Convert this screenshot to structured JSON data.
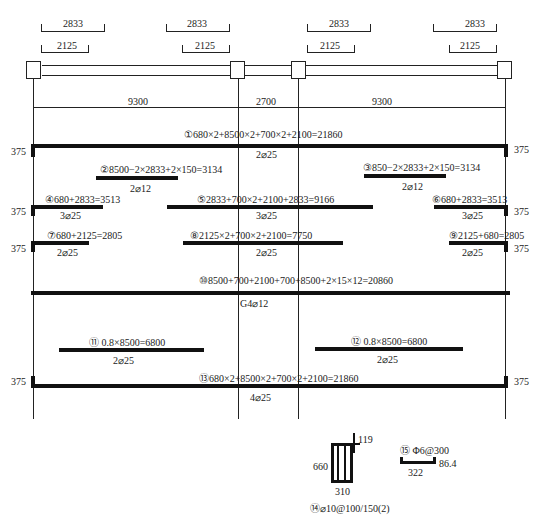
{
  "drawing": {
    "type": "beam reinforcement detail",
    "top_dimensions": [
      {
        "span": "left",
        "outer": "2833",
        "inner": "2125"
      },
      {
        "span": "left-right-end",
        "outer": "2833",
        "inner": "2125"
      },
      {
        "span": "right-left-end",
        "outer": "2833",
        "inner": "2125"
      },
      {
        "span": "right",
        "outer": "2833",
        "inner": "2125"
      }
    ],
    "spans": [
      "9300",
      "2700",
      "9300"
    ],
    "end_hook": "375",
    "bars": [
      {
        "id": "①",
        "formula": "680×2+8500×2+700×2+2100=21860",
        "spec": "2⌀25"
      },
      {
        "id": "②",
        "formula": "8500−2×2833+2×150=3134",
        "spec": "2⌀12"
      },
      {
        "id": "③",
        "formula": "850−2×2833+2×150=3134",
        "spec": "2⌀12"
      },
      {
        "id": "④",
        "formula": "680+2833=3513",
        "spec": "3⌀25"
      },
      {
        "id": "⑤",
        "formula": "2833+700×2+2100+2833=9166",
        "spec": "3⌀25"
      },
      {
        "id": "⑥",
        "formula": "680+2833=3513",
        "spec": "3⌀25"
      },
      {
        "id": "⑦",
        "formula": "680+2125=2805",
        "spec": "2⌀25"
      },
      {
        "id": "⑧",
        "formula": "2125×2+700×2+2100=7750",
        "spec": "2⌀25"
      },
      {
        "id": "⑨",
        "formula": "2125+680=2805",
        "spec": "2⌀25"
      },
      {
        "id": "⑩",
        "formula": "8500+700+2100+700+8500+2×15×12=20860",
        "spec": "G4⌀12"
      },
      {
        "id": "⑪",
        "formula": "0.8×8500=6800",
        "spec": "2⌀25"
      },
      {
        "id": "⑫",
        "formula": "0.8×8500=6800",
        "spec": "2⌀25"
      },
      {
        "id": "⑬",
        "formula": "680×2+8500×2+700×2+2100=21860",
        "spec": "4⌀25"
      }
    ],
    "stirrup": {
      "id": "⑭",
      "spec": "⌀10@100/150(2)",
      "height": "660",
      "width": "310",
      "hook": "119"
    },
    "tie": {
      "id": "⑮",
      "spec": "Φ6@300",
      "length": "322",
      "hook": "86.4"
    }
  }
}
